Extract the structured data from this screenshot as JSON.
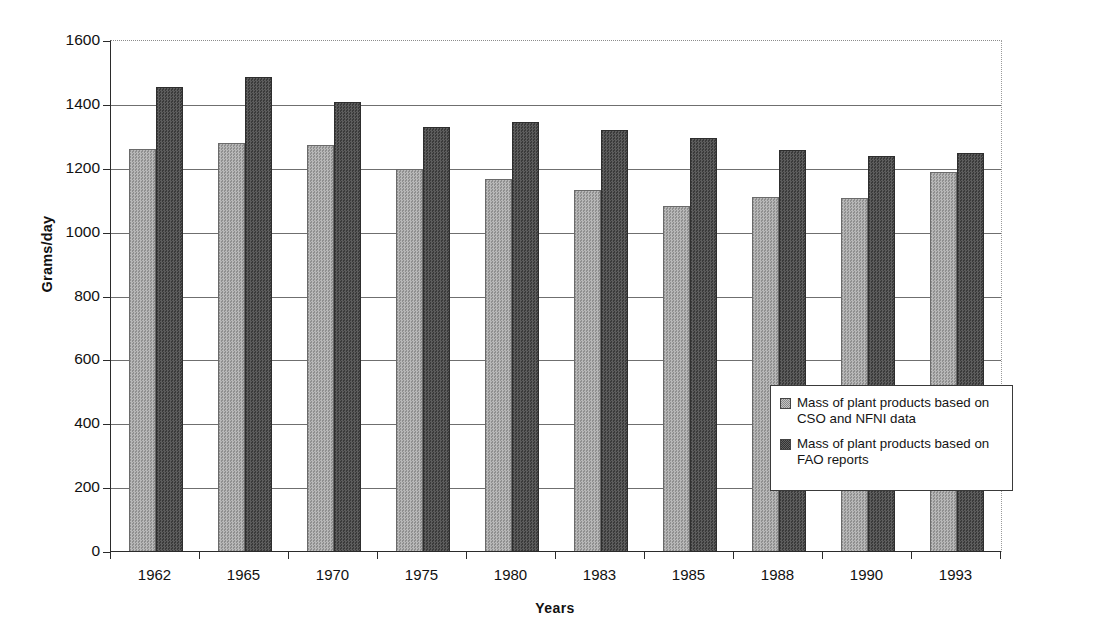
{
  "chart_data": {
    "type": "bar",
    "title": "",
    "xlabel": "Years",
    "ylabel": "Grams/day",
    "categories": [
      "1962",
      "1965",
      "1970",
      "1975",
      "1980",
      "1983",
      "1985",
      "1988",
      "1990",
      "1993"
    ],
    "ylim": [
      0,
      1600
    ],
    "ytick_values": [
      0,
      200,
      400,
      600,
      800,
      1000,
      1200,
      1400,
      1600
    ],
    "ytick_labels": [
      "0",
      "200",
      "400",
      "600",
      "800",
      "1000",
      "1200",
      "1400",
      "1600"
    ],
    "grid": "horizontal",
    "legend_position": "inside-right",
    "series": [
      {
        "name": "Mass of plant products based on CSO and NFNI data",
        "color": "#a6a6a6",
        "values": [
          1263,
          1281,
          1275,
          1198,
          1168,
          1133,
          1082,
          1113,
          1108,
          1190
        ]
      },
      {
        "name": "Mass of plant products based on FAO reports",
        "color": "#4d4d4d",
        "values": [
          1455,
          1487,
          1410,
          1330,
          1345,
          1320,
          1295,
          1258,
          1240,
          1248
        ]
      }
    ]
  },
  "legend": {
    "items": [
      {
        "label": "Mass of plant products based on CSO and NFNI data",
        "swatch": "light"
      },
      {
        "label": "Mass of plant products based on FAO reports",
        "swatch": "dark"
      }
    ]
  }
}
